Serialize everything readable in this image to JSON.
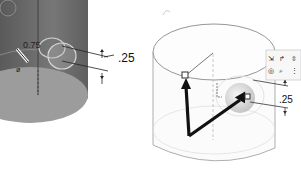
{
  "left_view": {
    "dimension_top": "0.75",
    "dimension_right": ".25",
    "body_color": "#6f6f6f",
    "bottom_face_color": "#9a9a9a"
  },
  "right_view": {
    "dimension_right": ".25",
    "arrow_color": "#111111",
    "toolbar_icons": [
      "move-icon",
      "rotate-icon",
      "scale-icon",
      "view-icon",
      "search-icon",
      "more-icon"
    ]
  }
}
